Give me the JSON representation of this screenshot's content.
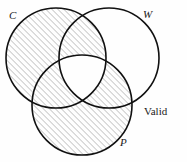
{
  "diagram": {
    "type": "venn-three-circle",
    "conclusion_label": "Valid",
    "circles": [
      {
        "id": "C",
        "label": "C",
        "cx": 56,
        "cy": 58,
        "r": 50
      },
      {
        "id": "W",
        "label": "W",
        "cx": 109,
        "cy": 58,
        "r": 50
      },
      {
        "id": "P",
        "label": "P",
        "cx": 82,
        "cy": 105,
        "r": 50
      }
    ],
    "shading": {
      "pattern": "diagonal-hatch",
      "angle_deg": 45,
      "spacing_px": 3,
      "line_color": "#8c8c8c",
      "description": "C union P shaded, except the central C-and-W-and-P overlap which is left unshaded",
      "shaded_regions": [
        "C only",
        "C and W only",
        "C and P only",
        "P only",
        "W and P only"
      ],
      "unshaded_regions": [
        "W only",
        "C and W and P"
      ]
    },
    "stroke_color": "#111111",
    "stroke_width": 1.6,
    "background_color": "#fefefe"
  }
}
